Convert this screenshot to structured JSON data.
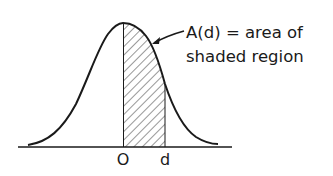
{
  "diagram": {
    "type": "normal-distribution-area",
    "annotation": {
      "line1": "A(d) = area of",
      "line2": "shaded region"
    },
    "axis_labels": {
      "origin": "O",
      "d": "d"
    },
    "colors": {
      "ink": "#1a1a1a",
      "background": "#ffffff"
    }
  }
}
